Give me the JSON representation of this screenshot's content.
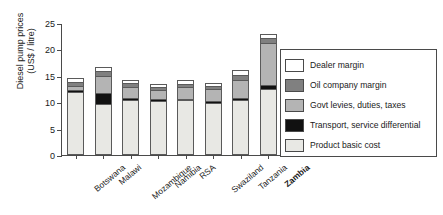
{
  "chart_data": {
    "type": "bar",
    "subtype": "stacked-vertical",
    "title": "",
    "xlabel": "",
    "ylabel": "Diesel pump prices (US$ / litre)",
    "ylabel_lines": [
      "Diesel pump prices",
      "(US$ / litre)"
    ],
    "ylim": [
      0,
      25
    ],
    "yticks": [
      0,
      5,
      10,
      15,
      20,
      25
    ],
    "ytick_labels": [
      "0",
      "5",
      "10",
      "15",
      "20",
      "25"
    ],
    "grid": false,
    "legend_position": "right",
    "categories": [
      "Botswana",
      "Malawi",
      "Mozambique",
      "Namibia",
      "RSA",
      "Swaziland",
      "Tanzania",
      "Zambia"
    ],
    "highlighted_category": "Zambia",
    "series": [
      {
        "name": "Product basic cost",
        "color": "#e8e8e4",
        "values": [
          12.0,
          9.6,
          10.5,
          10.3,
          10.4,
          9.9,
          10.5,
          12.5
        ]
      },
      {
        "name": "Transport, service differential",
        "color": "#111111",
        "values": [
          0.35,
          2.2,
          0.25,
          0.25,
          0.3,
          0.3,
          0.3,
          0.7
        ]
      },
      {
        "name": "Govt levies, duties, taxes",
        "color": "#b4b4b4",
        "values": [
          0.7,
          3.2,
          2.2,
          1.8,
          2.1,
          2.3,
          3.4,
          8.1
        ]
      },
      {
        "name": "Oil company margin",
        "color": "#808080",
        "values": [
          0.75,
          0.9,
          0.6,
          0.5,
          0.6,
          0.5,
          1.0,
          0.8
        ]
      },
      {
        "name": "Dealer margin",
        "color": "#ffffff",
        "values": [
          0.7,
          0.8,
          0.75,
          0.55,
          0.8,
          0.7,
          0.9,
          0.9
        ]
      }
    ],
    "totals": [
      14.5,
      16.7,
      14.3,
      13.4,
      14.2,
      13.7,
      16.1,
      23.0
    ]
  },
  "legend": {
    "items": [
      {
        "label": "Dealer margin",
        "color": "#ffffff"
      },
      {
        "label": "Oil company margin",
        "color": "#808080"
      },
      {
        "label": "Govt levies, duties, taxes",
        "color": "#b4b4b4"
      },
      {
        "label": "Transport, service differential",
        "color": "#111111"
      },
      {
        "label": "Product basic cost",
        "color": "#e8e8e4"
      }
    ]
  }
}
